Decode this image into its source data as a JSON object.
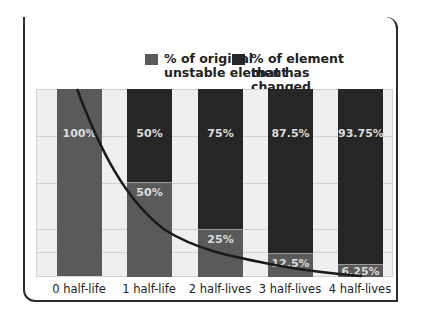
{
  "title": "Half-Life",
  "legend": [
    {
      "label": "% of original unstable element",
      "color": "#5a5a5a"
    },
    {
      "label": "% of element that has changed",
      "color": "#262626"
    }
  ],
  "chart_data": {
    "type": "bar",
    "stacked": true,
    "title": "Half-Life",
    "categories": [
      "0 half-life",
      "1 half-life",
      "2 half-lives",
      "3 half-lives",
      "4 half-lives"
    ],
    "series": [
      {
        "name": "% of original unstable element",
        "values": [
          100,
          50,
          25,
          12.5,
          6.25
        ],
        "color": "#5a5a5a"
      },
      {
        "name": "% of element that has changed",
        "values": [
          0,
          50,
          75,
          87.5,
          93.75
        ],
        "color": "#262626"
      }
    ],
    "labels": {
      "original": [
        "",
        "50%",
        "25%",
        "12.5%",
        "6.25%"
      ],
      "changed": [
        "100%",
        "50%",
        "75%",
        "87.5%",
        "93.75%"
      ]
    },
    "annotations": [
      "Decay curve overlay through top of remaining-original segments"
    ],
    "xlabel": "",
    "ylabel": "",
    "ylim": [
      0,
      100
    ],
    "grid": true,
    "legend_position": "top"
  }
}
